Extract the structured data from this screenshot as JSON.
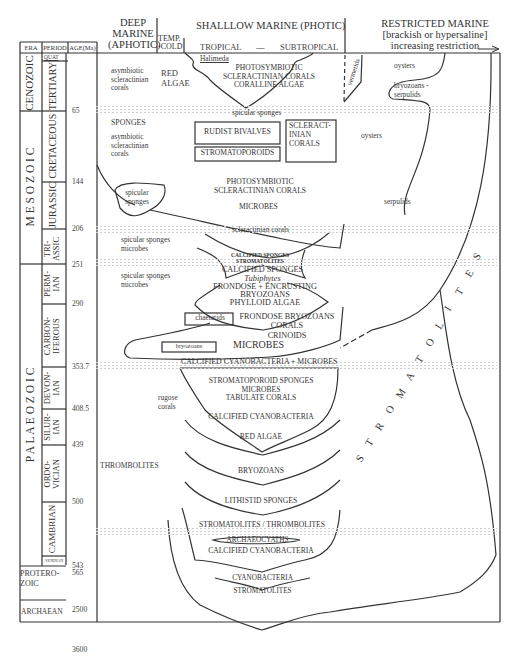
{
  "header": {
    "deep_marine": [
      "DEEP",
      "MARINE",
      "(APHOTIC)"
    ],
    "temp_cold": [
      "TEMP.",
      "-COLD"
    ],
    "shallow_marine": "SHALLLOW MARINE (PHOTIC)",
    "tropical": "TROPICAL",
    "dash": "—",
    "subtropical": "SUBTROPICAL",
    "restricted_marine": [
      "RESTRICTED MARINE",
      "[brackish or hypersaline]",
      "increasing restriction"
    ]
  },
  "columns": {
    "era": "ERA",
    "period": "PERIOD",
    "age": "AGE(Ma)"
  },
  "eras": [
    {
      "name": "CENOZOIC"
    },
    {
      "name": "M E S O Z O I C"
    },
    {
      "name": "P A L A E O Z O I C"
    },
    {
      "name": "PROTERO-ZOIC",
      "lines": [
        "PROTERO-",
        "ZOIC"
      ]
    },
    {
      "name": "ARCHAEAN"
    }
  ],
  "periods": [
    {
      "name": "QUAT"
    },
    {
      "name": "TERTIARY"
    },
    {
      "name": "CRETACEOUS"
    },
    {
      "name": "JURASSIC"
    },
    {
      "name": "TRI-ASSIC",
      "lines": [
        "TRI-",
        "ASSIC"
      ]
    },
    {
      "name": "PERM-IAN",
      "lines": [
        "PERM-",
        "IAN"
      ]
    },
    {
      "name": "CARBON-IFEROUS",
      "lines": [
        "CARBON-",
        "IFEROUS"
      ]
    },
    {
      "name": "DEVON-IAN",
      "lines": [
        "DEVON-",
        "IAN"
      ]
    },
    {
      "name": "SILUR-IAN",
      "lines": [
        "SILUR-",
        "IAN"
      ]
    },
    {
      "name": "ORDO-VICIAN",
      "lines": [
        "ORDO-",
        "VICIAN"
      ]
    },
    {
      "name": "CAMBRIAN"
    },
    {
      "name": "VENDIAN"
    }
  ],
  "ages": [
    "65",
    "144",
    "206",
    "251",
    "290",
    "353.7",
    "408.5",
    "439",
    "500",
    "543",
    "565",
    "2500",
    "3600"
  ],
  "labels": {
    "cenozoic_deep": [
      "asymbiotic",
      "scleractinian",
      "corals"
    ],
    "red_algae_cold": [
      "RED",
      "ALGAE"
    ],
    "halimeda": "Halimeda",
    "cenozoic_reef": [
      "PHOTOSYMBIOTIC",
      "SCLERACTINIAN CORALS",
      "CORALLINE ALGAE"
    ],
    "vermetids": "vermetids",
    "oysters_1": "oysters",
    "bryozoans_serpulids": [
      "bryozoans -",
      "serpulids"
    ],
    "spicular_sponges_top": "spicular sponges",
    "sponges": "SPONGES",
    "cretaceous_deep": [
      "asymbiotic",
      "scleractinian",
      "corals"
    ],
    "rudist_bivalves": "RUDIST BIVALVES",
    "stromatoporoids": "STROMATOPOROIDS",
    "scleractinian_corals_box": [
      "SCLERACT-",
      "INIAN",
      "CORALS"
    ],
    "oysters_2": "oysters",
    "spicular_sponges_lobe": [
      "spicular",
      "sponges"
    ],
    "jurassic_reef": [
      "PHOTOSYMBIOTIC",
      "SCLERACTINIAN CORALS"
    ],
    "microbes_jur": "MICROBES",
    "serpulids": "serpulids",
    "scleractinian_corals_tri": "scleractinian corals",
    "tri_deep": [
      "spicular sponges",
      "microbes"
    ],
    "tri_small": [
      "CALCIFIED SPONGES",
      "STROMATOLITES"
    ],
    "perm_deep": [
      "spicular sponges",
      "microbes"
    ],
    "perm_reef_1": "CALCIFIED SPONGES",
    "perm_reef_tub": "Tubiphytes",
    "perm_reef_2": [
      "FRONDOSE + ENCRUSTING",
      "BRYOZOANS",
      "PHYLLOID ALGAE"
    ],
    "chaetetids": "chaetetids",
    "carb_reef": [
      "FRONDOSE BRYOZOANS",
      "CORALS",
      "CRINOIDS"
    ],
    "bryozoans_box": "bryozoans",
    "microbes_carb": "MICROBES",
    "calc_cyano_microbes": "CALCIFIED CYANOBACTERIA + MICROBES",
    "rugose": [
      "rugose",
      "corals"
    ],
    "devon_reef": [
      "STROMATOPOROID SPONGES",
      "MICROBES",
      "TABULATE CORALS"
    ],
    "calc_cyano_dev": "CALCIFIED CYANOBACTERIA",
    "red_algae_sil": "RED ALGAE",
    "thrombolites": "THROMBOLITES",
    "bryozoans_ord": "BRYOZOANS",
    "lithistid": "LITHISTID SPONGES",
    "strom_throm": "STROMATOLITES /  THROMBOLITES",
    "archaeocyaths": "ARCHAEOCYATHS",
    "calc_cyano_cam": "CALCIFIED CYANOBACTERIA",
    "cyanobacteria": "CYANOBACTERIA",
    "stromatolites_pre": "STROMATOLITES",
    "stromatolites_big": [
      "S",
      "T",
      "R",
      "O",
      "M",
      "A",
      "T",
      "O",
      "L",
      "I",
      "T",
      "E",
      "S"
    ]
  }
}
